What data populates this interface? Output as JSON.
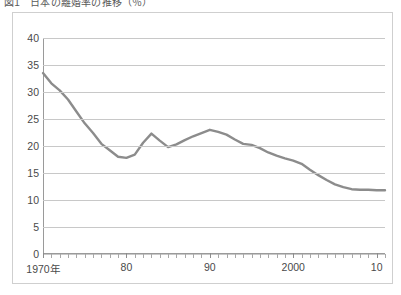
{
  "title": {
    "text": "図1　日本の離婚率の推移（％）",
    "clipped": true
  },
  "yaxis": {
    "labels": [
      "40",
      "35",
      "30",
      "25",
      "20",
      "15",
      "10",
      "5",
      "0"
    ],
    "min": 0,
    "max": 40,
    "step": 5
  },
  "xaxis": {
    "labels": [
      {
        "text": "1970年",
        "year": 1970
      },
      {
        "text": "80",
        "year": 1980
      },
      {
        "text": "90",
        "year": 1990
      },
      {
        "text": "2000",
        "year": 2000
      },
      {
        "text": "10",
        "year": 2010
      }
    ],
    "min": 1970,
    "max": 2011,
    "tick_interval": 1
  },
  "style": {
    "line_color": "#8c8c8c",
    "grid_color": "#c8c8c8",
    "axis_color": "#9a9a9a",
    "frame_color": "#cfcfcf",
    "text_color": "#4a4a4a",
    "background": "#ffffff",
    "line_width": 2.4
  },
  "chart_data": {
    "type": "line",
    "title": "図1　日本の離婚率の推移（％）",
    "xlabel": "",
    "ylabel": "",
    "xlim": [
      1970,
      2011
    ],
    "ylim": [
      0,
      40
    ],
    "grid": true,
    "legend": false,
    "x": [
      1970,
      1971,
      1972,
      1973,
      1974,
      1975,
      1976,
      1977,
      1978,
      1979,
      1980,
      1981,
      1982,
      1983,
      1984,
      1985,
      1986,
      1987,
      1988,
      1989,
      1990,
      1991,
      1992,
      1993,
      1994,
      1995,
      1996,
      1997,
      1998,
      1999,
      2000,
      2001,
      2002,
      2003,
      2004,
      2005,
      2006,
      2007,
      2008,
      2009,
      2010,
      2011
    ],
    "series": [
      {
        "name": "率",
        "values": [
          33.5,
          31.6,
          30.3,
          28.6,
          26.4,
          24.2,
          22.4,
          20.4,
          19.2,
          18.0,
          17.8,
          18.4,
          20.6,
          22.3,
          21.0,
          19.8,
          20.3,
          21.1,
          21.8,
          22.4,
          23.0,
          22.6,
          22.1,
          21.2,
          20.4,
          20.2,
          19.6,
          18.8,
          18.2,
          17.7,
          17.3,
          16.7,
          15.6,
          14.6,
          13.7,
          12.9,
          12.4,
          12.0,
          11.9,
          11.9,
          11.8,
          11.8
        ]
      }
    ]
  }
}
